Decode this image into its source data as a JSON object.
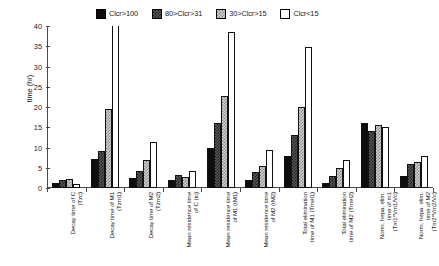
{
  "chart_data": {
    "type": "bar",
    "title": "",
    "xlabel": "",
    "ylabel": "time (hr)",
    "ylim": [
      0,
      40
    ],
    "yticks": [
      0,
      5,
      10,
      15,
      20,
      25,
      30,
      35,
      40
    ],
    "grid": false,
    "legend_position": "top",
    "categories": [
      "Decay time of C\n(Tzc)",
      "Decay time of M1\n(Tzm1)",
      "Decay time of M2\n(Tzm2)",
      "Mean residence time\nof C (tc)",
      "Mean residence time\nof M1 (tM1)",
      "Mean residence time\nof M2 (tM2)",
      "Total elimination\ntime of M1 (Tmel1)",
      "Total elimination\ntime of M2 (Tmel2)",
      "Norm. hepa. elim.\ntime of m1\n(Tm1*Vm1/Vc)",
      "Norm. hepa. elim.\ntime of M2\n(Tm2*Vm2/Vc)"
    ],
    "series": [
      {
        "name": "Clcr>100",
        "values": [
          1.2,
          7.2,
          2.5,
          1.9,
          9.9,
          2.0,
          7.9,
          1.2,
          16.0,
          3.0
        ]
      },
      {
        "name": "80>Clcr>31",
        "values": [
          1.9,
          9.1,
          4.1,
          3.1,
          16.0,
          4.0,
          13.0,
          3.0,
          14.2,
          6.0
        ]
      },
      {
        "name": "30>Clcr>15",
        "values": [
          2.3,
          19.4,
          6.8,
          2.8,
          22.6,
          5.5,
          20.0,
          5.0,
          15.6,
          6.5
        ]
      },
      {
        "name": "Clcr<15",
        "values": [
          0.9,
          46.0,
          11.3,
          4.1,
          38.5,
          9.5,
          34.7,
          7.0,
          15.0,
          8.0
        ]
      }
    ],
    "series_notes": "Clcr<15 bar in 'Decay time of M1' group exceeds the axis maximum and is drawn clipped at the top of the plot."
  },
  "legend": {
    "items": [
      {
        "label": "Clcr>100",
        "fill": "solid-black"
      },
      {
        "label": "80>Clcr>31",
        "fill": "dark-checker"
      },
      {
        "label": "30>Clcr>15",
        "fill": "light-checker"
      },
      {
        "label": "Clcr<15",
        "fill": "white-outline"
      }
    ]
  },
  "colors": {
    "series_1": "#0d0d0d",
    "series_2": "#1c1c1c",
    "series_3": "#868686",
    "series_4": "#ffffff",
    "axis": "#4a4a4a",
    "background": "#ffffff"
  }
}
